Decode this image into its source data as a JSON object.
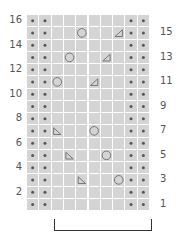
{
  "chart": {
    "title": "",
    "columns": 10,
    "rows": 16,
    "colors": {
      "cell": "#d4d4d4",
      "gridline": "#ffffff",
      "dot": "#555555",
      "symbol_stroke": "#777777",
      "label": "#555555",
      "bracket": "#333333"
    },
    "left_labels": [
      "16",
      "14",
      "12",
      "10",
      "8",
      "6",
      "4",
      "2"
    ],
    "right_labels": [
      "15",
      "13",
      "11",
      "9",
      "7",
      "5",
      "3",
      "1"
    ],
    "dot_columns": [
      1,
      2,
      9,
      10
    ],
    "symbols": [
      {
        "row": 15,
        "col": 5,
        "type": "circle"
      },
      {
        "row": 15,
        "col": 8,
        "type": "triangle-right"
      },
      {
        "row": 13,
        "col": 4,
        "type": "circle"
      },
      {
        "row": 13,
        "col": 7,
        "type": "triangle-right"
      },
      {
        "row": 11,
        "col": 3,
        "type": "circle"
      },
      {
        "row": 11,
        "col": 6,
        "type": "triangle-right"
      },
      {
        "row": 7,
        "col": 3,
        "type": "triangle-left"
      },
      {
        "row": 7,
        "col": 6,
        "type": "circle"
      },
      {
        "row": 5,
        "col": 4,
        "type": "triangle-left"
      },
      {
        "row": 5,
        "col": 7,
        "type": "circle"
      },
      {
        "row": 3,
        "col": 5,
        "type": "triangle-left"
      },
      {
        "row": 3,
        "col": 8,
        "type": "circle"
      }
    ],
    "repeat_bracket": {
      "from_col": 3,
      "to_col": 10
    }
  }
}
